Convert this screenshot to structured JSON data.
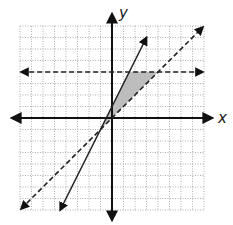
{
  "chart_data": {
    "type": "line",
    "title": "",
    "xlabel": "x",
    "ylabel": "y",
    "xlim": [
      -8,
      8
    ],
    "ylim": [
      -8,
      8
    ],
    "grid": true,
    "grid_style": "dotted",
    "series": [
      {
        "name": "y = 2x + 1",
        "style": "solid",
        "slope": 2,
        "intercept": 1,
        "x_range": [
          -4.5,
          3
        ],
        "arrows": "both"
      },
      {
        "name": "y = x",
        "style": "dashed",
        "slope": 1,
        "intercept": 0,
        "x_range": [
          -7.9,
          7.9
        ],
        "arrows": "both"
      },
      {
        "name": "y = 4",
        "style": "dashed",
        "slope": 0,
        "intercept": 4,
        "x_range": [
          -7.9,
          7.9
        ],
        "arrows": "both"
      }
    ],
    "shaded_region": {
      "description": "Region bounded by y = 2x + 1, y = x, and y = 4",
      "vertices": [
        [
          -1,
          -1
        ],
        [
          1.5,
          4
        ],
        [
          4,
          4
        ]
      ],
      "fill": "#bdbdbd"
    }
  },
  "labels": {
    "x_axis": "x",
    "y_axis": "y"
  },
  "colors": {
    "axis": "#111111",
    "grid": "#9a9a9a",
    "line": "#222222",
    "shade": "#bdbdbd"
  }
}
